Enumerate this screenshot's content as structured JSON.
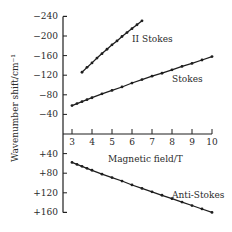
{
  "chart_data": {
    "type": "line",
    "title": "",
    "xlabel": "Magnetic field/T",
    "ylabel": "Wavenumber shift/cm⁻¹",
    "xlim": [
      3,
      10
    ],
    "ylim": [
      -240,
      160
    ],
    "x_ticks": [
      3,
      4,
      5,
      6,
      7,
      8,
      9,
      10
    ],
    "x_tick_labels": [
      "3",
      "4",
      "5",
      "6",
      "7",
      "8",
      "9",
      "10"
    ],
    "y_ticks": [
      -240,
      -200,
      -160,
      -120,
      -80,
      -40,
      40,
      80,
      120,
      160
    ],
    "y_tick_labels": [
      "−240",
      "−200",
      "−160",
      "−120",
      "−80",
      "−40",
      "+40",
      "+80",
      "+120",
      "+160"
    ],
    "grid": false,
    "legend": "inline labels",
    "series": [
      {
        "name": "II Stokes",
        "x": [
          3.5,
          3.75,
          4.0,
          4.25,
          4.5,
          4.75,
          5.0,
          5.25,
          5.5,
          5.75,
          6.0,
          6.25,
          6.5
        ],
        "values": [
          -126,
          -136,
          -145,
          -155,
          -164,
          -173,
          -182,
          -190,
          -199,
          -207,
          -215,
          -223,
          -231
        ]
      },
      {
        "name": "Stokes",
        "x": [
          3.0,
          3.25,
          3.5,
          3.75,
          4.0,
          4.5,
          5.0,
          5.5,
          6.0,
          6.5,
          7.0,
          7.5,
          8.0,
          8.5,
          9.0,
          9.5,
          10.0
        ],
        "values": [
          -58,
          -62,
          -66,
          -70,
          -74,
          -82,
          -89,
          -96,
          -104,
          -111,
          -118,
          -124,
          -131,
          -138,
          -144,
          -151,
          -158
        ]
      },
      {
        "name": "Anti-Stokes",
        "x": [
          3.0,
          3.25,
          3.5,
          3.75,
          4.0,
          4.5,
          5.0,
          5.5,
          6.0,
          6.5,
          7.0,
          7.5,
          8.0,
          8.5,
          9.0,
          9.5,
          10.0
        ],
        "values": [
          58,
          62,
          66,
          70,
          74,
          82,
          89,
          96,
          104,
          111,
          118,
          125,
          132,
          139,
          146,
          153,
          160
        ]
      }
    ]
  },
  "labels": {
    "ii_stokes": "II Stokes",
    "stokes": "Stokes",
    "anti_stokes": "Anti-Stokes",
    "xlabel": "Magnetic field/T",
    "ylabel": "Wavenumber shift/cm⁻¹"
  }
}
